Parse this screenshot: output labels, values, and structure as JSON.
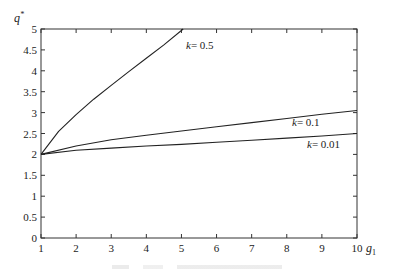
{
  "chart_data": {
    "type": "line",
    "title": "",
    "xlabel": "g1",
    "ylabel": "q*",
    "xlim": [
      1,
      10
    ],
    "ylim": [
      0,
      5
    ],
    "xticks": [
      1,
      2,
      3,
      4,
      5,
      6,
      7,
      8,
      9,
      10
    ],
    "yticks": [
      0,
      0.5,
      1,
      1.5,
      2,
      2.5,
      3,
      3.5,
      4,
      4.5,
      5
    ],
    "ytick_labels": [
      "0",
      "0.5",
      "1",
      "1.5",
      "2",
      "2.5",
      "3",
      "3.5",
      "4",
      "4.5",
      "5"
    ],
    "xtick_labels": [
      "1",
      "2",
      "3",
      "4",
      "5",
      "6",
      "7",
      "8",
      "9",
      "10"
    ],
    "grid": false,
    "legend": "inline labels",
    "series": [
      {
        "name": "k = 0.5",
        "label": "k = 0.5",
        "x": [
          1,
          1.5,
          2,
          2.5,
          3,
          3.5,
          4,
          4.5,
          5.05
        ],
        "y": [
          2.0,
          2.55,
          2.95,
          3.32,
          3.65,
          3.98,
          4.3,
          4.62,
          5.0
        ]
      },
      {
        "name": "k = 0.1",
        "label": "k = 0.1",
        "x": [
          1,
          2,
          3,
          4,
          5,
          6,
          7,
          8,
          9,
          10
        ],
        "y": [
          2.0,
          2.2,
          2.35,
          2.46,
          2.56,
          2.66,
          2.76,
          2.86,
          2.96,
          3.05
        ]
      },
      {
        "name": "k = 0.01",
        "label": "k = 0.01",
        "x": [
          1,
          2,
          3,
          4,
          5,
          6,
          7,
          8,
          9,
          10
        ],
        "y": [
          2.0,
          2.1,
          2.15,
          2.2,
          2.24,
          2.29,
          2.34,
          2.39,
          2.44,
          2.5
        ]
      }
    ],
    "annotations": [
      {
        "text": "k = 0.5",
        "x": 5.2,
        "y": 4.55
      },
      {
        "text": "k = 0.1",
        "x": 8.3,
        "y": 2.65
      },
      {
        "text": "k = 0.01",
        "x": 8.7,
        "y": 2.2
      }
    ]
  },
  "labels": {
    "y_axis": "q",
    "y_axis_sup": "*",
    "x_axis": "g",
    "x_axis_sub": "1",
    "series_k05": "k",
    "series_k05_val": "= 0.5",
    "series_k01": "k",
    "series_k01_val": "= 0.1",
    "series_k001": "k",
    "series_k001_val": "= 0.01"
  }
}
